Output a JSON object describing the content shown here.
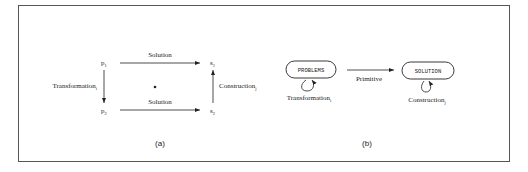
{
  "figure": {
    "panel_a": {
      "caption": "(a)",
      "nodes": {
        "p1": "p",
        "p1_sub": "1",
        "p2": "p",
        "p2_sub": "2",
        "s1": "s",
        "s1_sub": "1",
        "s2": "s",
        "s2_sub": "2"
      },
      "edges": {
        "top": "Solution",
        "bottom": "Solution",
        "left": "Transformation",
        "left_sub": "i",
        "right": "Construction",
        "right_sub": "j"
      },
      "center_mark": "•"
    },
    "panel_b": {
      "caption": "(b)",
      "nodes": {
        "problems": "PROBLEMS",
        "solution": "SOLUTION"
      },
      "edges": {
        "primitive": "Primitive",
        "loop_left": "Transformation",
        "loop_left_sub": "i",
        "loop_right": "Construction",
        "loop_right_sub": "j"
      }
    }
  }
}
